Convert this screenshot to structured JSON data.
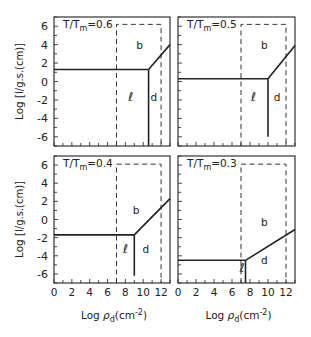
{
  "chart_data": [
    {
      "type": "line",
      "title": "T/Tm=0.6",
      "panel": "top-left",
      "xlabel": "",
      "ylabel": "Log [l/g.s.(cm)]",
      "xlim": [
        0,
        13
      ],
      "ylim": [
        -7,
        7
      ],
      "x_ticks": [],
      "y_ticks": [
        "6",
        "4",
        "2",
        "0",
        "-2",
        "-4",
        "-6"
      ],
      "dashed_box": {
        "x0": 7,
        "x1": 12,
        "y_top": 6.2
      },
      "solid_lines": [
        {
          "name": "horizontal",
          "points": [
            [
              0,
              1.3
            ],
            [
              10.6,
              1.3
            ]
          ]
        },
        {
          "name": "vertical",
          "points": [
            [
              10.6,
              1.3
            ],
            [
              10.6,
              -7
            ]
          ]
        },
        {
          "name": "slope",
          "points": [
            [
              10.6,
              1.3
            ],
            [
              13,
              4.0
            ]
          ]
        }
      ],
      "region_labels": [
        {
          "text": "b",
          "x": 9.6,
          "y": 4
        },
        {
          "text": "ℓ",
          "x": 8.6,
          "y": -1.7
        },
        {
          "text": "d",
          "x": 11.2,
          "y": -1.7
        }
      ]
    },
    {
      "type": "line",
      "title": "T/Tm=0.5",
      "panel": "top-right",
      "xlabel": "",
      "ylabel": "",
      "xlim": [
        0,
        13
      ],
      "ylim": [
        -7,
        7
      ],
      "dashed_box": {
        "x0": 7,
        "x1": 12,
        "y_top": 6.2
      },
      "solid_lines": [
        {
          "name": "horizontal",
          "points": [
            [
              0,
              0.3
            ],
            [
              10,
              0.3
            ]
          ]
        },
        {
          "name": "vertical",
          "points": [
            [
              10,
              0.3
            ],
            [
              10,
              -6
            ]
          ]
        },
        {
          "name": "slope",
          "points": [
            [
              10,
              0.3
            ],
            [
              13,
              3.9
            ]
          ]
        }
      ],
      "region_labels": [
        {
          "text": "b",
          "x": 9.6,
          "y": 4
        },
        {
          "text": "ℓ",
          "x": 8.4,
          "y": -1.7
        },
        {
          "text": "d",
          "x": 11,
          "y": -1.7
        }
      ]
    },
    {
      "type": "line",
      "title": "T/Tm=0.4",
      "panel": "bottom-left",
      "xlabel": "Log ρd(cm-2)",
      "ylabel": "Log [l/g.s.(cm)]",
      "xlim": [
        0,
        13
      ],
      "ylim": [
        -7,
        7
      ],
      "x_ticks": [
        "0",
        "2",
        "4",
        "6",
        "8",
        "10",
        "12"
      ],
      "y_ticks": [
        "6",
        "4",
        "2",
        "0",
        "-2",
        "-4",
        "-6"
      ],
      "dashed_box": {
        "x0": 7,
        "x1": 12,
        "y_top": 6.1
      },
      "solid_lines": [
        {
          "name": "horizontal",
          "points": [
            [
              0,
              -1.7
            ],
            [
              9,
              -1.7
            ]
          ]
        },
        {
          "name": "vertical",
          "points": [
            [
              9,
              -1.7
            ],
            [
              9,
              -6.2
            ]
          ]
        },
        {
          "name": "slope",
          "points": [
            [
              9,
              -1.7
            ],
            [
              13,
              2.3
            ]
          ]
        }
      ],
      "region_labels": [
        {
          "text": "b",
          "x": 9.2,
          "y": 1
        },
        {
          "text": "ℓ",
          "x": 8,
          "y": -3.2
        },
        {
          "text": "d",
          "x": 10.3,
          "y": -3.2
        }
      ]
    },
    {
      "type": "line",
      "title": "T/Tm=0.3",
      "panel": "bottom-right",
      "xlabel": "Log ρd(cm-2)",
      "ylabel": "",
      "xlim": [
        0,
        13
      ],
      "ylim": [
        -7,
        7
      ],
      "x_ticks": [
        "0",
        "2",
        "4",
        "6",
        "8",
        "10",
        "12"
      ],
      "dashed_box": {
        "x0": 7,
        "x1": 12,
        "y_top": 6.1
      },
      "solid_lines": [
        {
          "name": "horizontal",
          "points": [
            [
              0,
              -4.5
            ],
            [
              7.5,
              -4.5
            ]
          ]
        },
        {
          "name": "vertical",
          "points": [
            [
              7.5,
              -4.5
            ],
            [
              7.5,
              -7
            ]
          ]
        },
        {
          "name": "slope",
          "points": [
            [
              7.5,
              -4.5
            ],
            [
              13,
              -1.1
            ]
          ]
        }
      ],
      "region_labels": [
        {
          "text": "b",
          "x": 9.6,
          "y": -0.3
        },
        {
          "text": "ℓ",
          "x": 7.1,
          "y": -5.4
        },
        {
          "text": "d",
          "x": 9.6,
          "y": -4.5
        }
      ]
    }
  ],
  "labels": {
    "ylabel_main": "Log",
    "ylabel_bracket": "[l/g.s.(cm)]",
    "xlabel_main": "Log ",
    "xlabel_rho": "ρ",
    "xlabel_sub": "d",
    "xlabel_unit": "(cm",
    "xlabel_exp": "-2",
    "xlabel_close": ")",
    "title_prefix": "T/T",
    "title_sub": "m",
    "titles": [
      "=0.6",
      "=0.5",
      "=0.4",
      "=0.3"
    ],
    "region_b": "b",
    "region_l": "ℓ",
    "region_d": "d",
    "x_ticks": [
      "0",
      "2",
      "4",
      "6",
      "8",
      "10",
      "12"
    ],
    "y_ticks": [
      "6",
      "4",
      "2",
      "0",
      "-2",
      "-4",
      "-6"
    ]
  }
}
